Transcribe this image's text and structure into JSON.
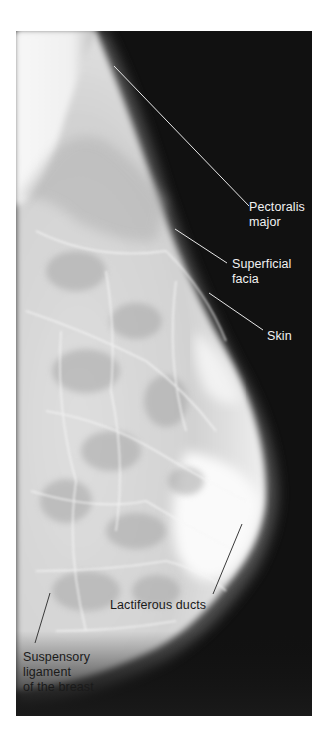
{
  "figure": {
    "type": "annotated mammogram (mediolateral view)",
    "labels": [
      {
        "id": "pectoralis",
        "text": "Pectoralis\nmajor"
      },
      {
        "id": "facia",
        "text": "Superficial\nfacia"
      },
      {
        "id": "skin",
        "text": "Skin"
      },
      {
        "id": "ducts",
        "text": "Lactiferous ducts"
      },
      {
        "id": "ligament",
        "text": "Suspensory\nligament\nof the breast"
      }
    ]
  },
  "colors": {
    "background": "#111111",
    "tissue_light": "#f4f4f4",
    "tissue_mid": "#cfcfcf",
    "label_light": "#f2f2f2",
    "label_dark": "#1a1a1a"
  }
}
